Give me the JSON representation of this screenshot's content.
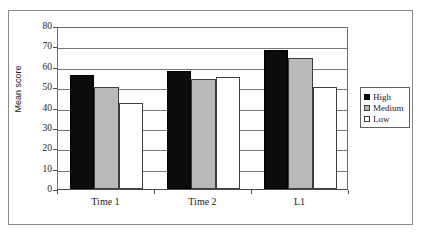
{
  "chart_data": {
    "type": "bar",
    "title": "",
    "xlabel": "",
    "ylabel": "Mean score",
    "categories": [
      "Time 1",
      "Time 2",
      "L1"
    ],
    "series": [
      {
        "name": "High",
        "color": "#0c0c0c",
        "values": [
          56,
          58,
          68
        ]
      },
      {
        "name": "Medium",
        "color": "#b9b9b9",
        "values": [
          50,
          54,
          64.5
        ]
      },
      {
        "name": "Low",
        "color": "#ffffff",
        "values": [
          42,
          55,
          50
        ]
      }
    ],
    "ylim": [
      0,
      80
    ],
    "ytick_step": 10,
    "yticks": [
      80,
      70,
      60,
      50,
      40,
      30,
      20,
      10,
      0
    ],
    "ytick_labels": [
      "80",
      "70",
      "60",
      "50",
      "40",
      "30",
      "20",
      "10",
      "0"
    ],
    "grid": true,
    "grid_axis": "y",
    "legend_position": "right",
    "legend_entries": [
      "High",
      "Medium",
      "Low"
    ]
  },
  "figure": {
    "axis_line_color": "#6f6f6f",
    "grid_color": "#767676",
    "frame_color": "#8a8a8a",
    "background": "#ffffff"
  }
}
